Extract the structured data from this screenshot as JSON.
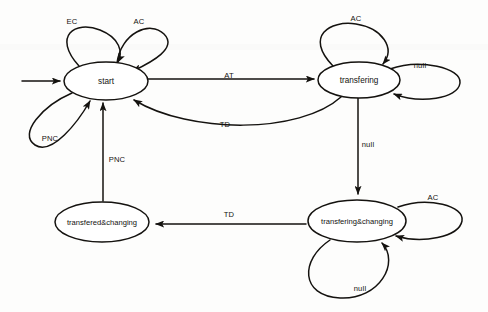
{
  "diagram": {
    "type": "state-machine",
    "nodes": [
      {
        "id": "start",
        "label": "start",
        "cx": 106,
        "cy": 81,
        "rx": 42,
        "ry": 19
      },
      {
        "id": "transfering",
        "label": "transfering",
        "cx": 359,
        "cy": 80,
        "rx": 41,
        "ry": 18
      },
      {
        "id": "transferedchanging",
        "label": "transfered&changing",
        "cx": 102,
        "cy": 222,
        "rx": 47,
        "ry": 20
      },
      {
        "id": "transferingchanging",
        "label": "transfering&changing",
        "cx": 357,
        "cy": 221,
        "rx": 49,
        "ry": 21
      }
    ],
    "edges": [
      {
        "id": "initial",
        "from": "",
        "to": "start",
        "label": ""
      },
      {
        "id": "start-ec",
        "from": "start",
        "to": "start",
        "label": "EC",
        "lx": 72,
        "ly": 22
      },
      {
        "id": "start-ac",
        "from": "start",
        "to": "start",
        "label": "AC",
        "lx": 139,
        "ly": 22
      },
      {
        "id": "start-pnc",
        "from": "start",
        "to": "start",
        "label": "PNC",
        "lx": 50,
        "ly": 139
      },
      {
        "id": "start-to-transfering",
        "from": "start",
        "to": "transfering",
        "label": "AT",
        "lx": 229,
        "ly": 76
      },
      {
        "id": "transfering-to-start",
        "from": "transfering",
        "to": "start",
        "label": "TD",
        "lx": 225,
        "ly": 125
      },
      {
        "id": "transfering-null",
        "from": "transfering",
        "to": "transfering",
        "label": "null",
        "lx": 420,
        "ly": 66
      },
      {
        "id": "transfering-ac",
        "from": "transfering",
        "to": "transfering",
        "label": "AC",
        "lx": 356,
        "ly": 19
      },
      {
        "id": "transfering-to-tc",
        "from": "transfering",
        "to": "transferingchanging",
        "label": "null",
        "lx": 368,
        "ly": 145
      },
      {
        "id": "tc-ac",
        "from": "transferingchanging",
        "to": "transferingchanging",
        "label": "AC",
        "lx": 433,
        "ly": 198
      },
      {
        "id": "tc-null",
        "from": "transferingchanging",
        "to": "transferingchanging",
        "label": "null",
        "lx": 360,
        "ly": 289
      },
      {
        "id": "tc-to-tdc",
        "from": "transferingchanging",
        "to": "transferedchanging",
        "label": "TD",
        "lx": 229,
        "ly": 215
      },
      {
        "id": "tdc-to-start",
        "from": "transferedchanging",
        "to": "start",
        "label": "PNC",
        "lx": 117,
        "ly": 160
      }
    ],
    "colors": {
      "stroke": "#14120f",
      "node_fill": "#ffffff",
      "background": "#fdfdfc"
    }
  }
}
